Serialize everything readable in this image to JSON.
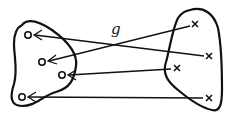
{
  "diagram": {
    "title_label": "g",
    "domain_set": {
      "name": "left-set",
      "points": [
        {
          "id": "a1",
          "marker": "o",
          "x": 28,
          "y": 35
        },
        {
          "id": "a2",
          "marker": "o",
          "x": 42,
          "y": 62
        },
        {
          "id": "a3",
          "marker": "o",
          "x": 62,
          "y": 75
        },
        {
          "id": "a4",
          "marker": "o",
          "x": 22,
          "y": 97
        }
      ]
    },
    "codomain_set": {
      "name": "right-set",
      "points": [
        {
          "id": "b1",
          "marker": "x",
          "x": 195,
          "y": 24
        },
        {
          "id": "b2",
          "marker": "x",
          "x": 209,
          "y": 56
        },
        {
          "id": "b3",
          "marker": "x",
          "x": 177,
          "y": 68
        },
        {
          "id": "b4",
          "marker": "x",
          "x": 209,
          "y": 98
        }
      ]
    },
    "arrows": [
      {
        "from": "b1",
        "to": "a2"
      },
      {
        "from": "b2",
        "to": "a1"
      },
      {
        "from": "b3",
        "to": "a3"
      },
      {
        "from": "b4",
        "to": "a4"
      }
    ],
    "colors": {
      "ink": "#111111",
      "background": "#ffffff"
    }
  }
}
